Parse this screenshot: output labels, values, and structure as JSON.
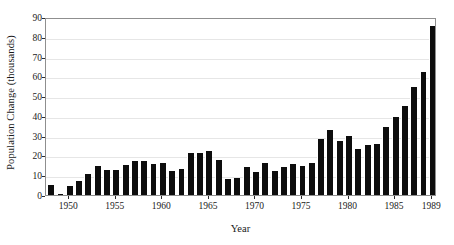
{
  "chart_data": {
    "type": "bar",
    "title": "",
    "xlabel": "Year",
    "ylabel": "Population Change (thousands)",
    "ylim": [
      0,
      90
    ],
    "ytick_values": [
      0,
      10,
      20,
      30,
      40,
      50,
      60,
      70,
      80,
      90
    ],
    "ytick_labels": [
      "0",
      "10",
      "20",
      "30",
      "40",
      "50",
      "60",
      "70",
      "80",
      "90"
    ],
    "xtick_labels": [
      "1950",
      "1955",
      "1960",
      "1965",
      "1970",
      "1975",
      "1980",
      "1985",
      "1989"
    ],
    "xtick_years": [
      1950,
      1955,
      1960,
      1965,
      1970,
      1975,
      1980,
      1985,
      1989
    ],
    "grid": true,
    "legend": false,
    "bar_color": "#0d0d0d",
    "grid_color": "#e6e6e6",
    "axis_color": "#8f8f8f",
    "categories": [
      1948,
      1949,
      1950,
      1951,
      1952,
      1953,
      1954,
      1955,
      1956,
      1957,
      1958,
      1959,
      1960,
      1961,
      1962,
      1963,
      1964,
      1965,
      1966,
      1967,
      1968,
      1969,
      1970,
      1971,
      1972,
      1973,
      1974,
      1975,
      1976,
      1977,
      1978,
      1979,
      1980,
      1981,
      1982,
      1983,
      1984,
      1985,
      1986,
      1987,
      1988,
      1989
    ],
    "values": [
      5.0,
      0.6,
      4.8,
      7.0,
      10.5,
      14.6,
      12.4,
      12.8,
      15.0,
      17.2,
      17.2,
      15.6,
      16.0,
      11.9,
      13.2,
      21.0,
      21.3,
      22.2,
      17.8,
      8.0,
      8.8,
      14.1,
      11.6,
      16.2,
      12.3,
      14.4,
      15.6,
      14.5,
      16.3,
      28.2,
      32.7,
      27.5,
      30.0,
      23.1,
      25.1,
      25.8,
      34.2,
      39.5,
      44.8,
      54.8,
      62.1,
      85.4
    ]
  }
}
